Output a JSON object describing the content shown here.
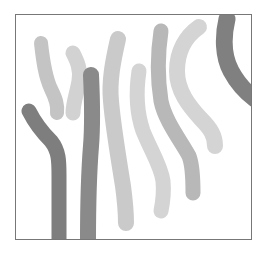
{
  "image": {
    "description": "Abstract composition of vertical gray brush strokes inside a thin rectangular frame",
    "frame": {
      "border_color": "#777777",
      "background": "#ffffff"
    },
    "strokes": [
      {
        "id": "s1",
        "color": "#c4c4c4",
        "width": 14,
        "path": "M40 42 C42 60 44 75 50 88 C55 98 57 104 56 112"
      },
      {
        "id": "s2",
        "color": "#d2d2d2",
        "width": 15,
        "path": "M72 52 C76 60 80 68 78 80 C76 92 72 102 72 112"
      },
      {
        "id": "s3",
        "color": "#7e7e7e",
        "width": 15,
        "path": "M28 110 C34 122 40 130 50 140 C58 150 58 160 58 175 C58 195 58 215 58 240"
      },
      {
        "id": "s4",
        "color": "#8a8a8a",
        "width": 16,
        "path": "M90 74 C91 95 92 120 90 145 C88 170 87 200 87 240"
      },
      {
        "id": "s5",
        "color": "#cacaca",
        "width": 16,
        "path": "M117 38 C112 60 108 80 110 100 C112 125 118 160 122 185 C124 200 125 210 125 222"
      },
      {
        "id": "s6",
        "color": "#d4d4d4",
        "width": 15,
        "path": "M138 70 C135 90 135 110 142 130 C150 150 160 165 162 180 C163 190 162 200 160 210"
      },
      {
        "id": "s7",
        "color": "#b8b8b8",
        "width": 15,
        "path": "M160 30 C157 50 156 75 160 100 C164 120 180 140 188 155 C192 165 192 180 192 192"
      },
      {
        "id": "s8",
        "color": "#d4d4d4",
        "width": 16,
        "path": "M198 26 C185 35 176 50 176 70 C176 90 188 105 200 118 C210 128 214 135 214 145"
      },
      {
        "id": "s9",
        "color": "#808080",
        "width": 17,
        "path": "M226 18 C222 35 222 55 230 70 C238 85 246 92 254 98"
      }
    ]
  }
}
